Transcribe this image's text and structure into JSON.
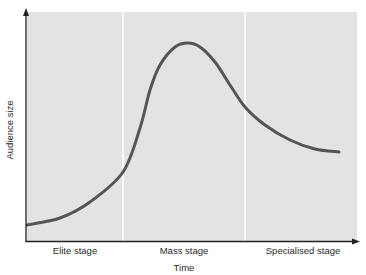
{
  "chart_data": {
    "type": "line",
    "title": "",
    "xlabel": "Time",
    "ylabel": "Audience size",
    "categories": [
      "Elite stage",
      "Mass stage",
      "Specialised stage"
    ],
    "x_ticks": [],
    "y_ticks": [],
    "grid": false,
    "legend": null,
    "series": [
      {
        "name": "Audience size over time",
        "points_px": [
          [
            27,
            225
          ],
          [
            60,
            218
          ],
          [
            90,
            202
          ],
          [
            123,
            172
          ],
          [
            140,
            128
          ],
          [
            150,
            90
          ],
          [
            160,
            65
          ],
          [
            175,
            47
          ],
          [
            188,
            43
          ],
          [
            200,
            47
          ],
          [
            215,
            62
          ],
          [
            230,
            85
          ],
          [
            245,
            107
          ],
          [
            265,
            125
          ],
          [
            290,
            140
          ],
          [
            315,
            149
          ],
          [
            339,
            152
          ]
        ],
        "values_normalized": [
          {
            "x": 0.0,
            "y": 0.07
          },
          {
            "x": 0.1,
            "y": 0.1
          },
          {
            "x": 0.19,
            "y": 0.18
          },
          {
            "x": 0.29,
            "y": 0.33
          },
          {
            "x": 0.34,
            "y": 0.54
          },
          {
            "x": 0.37,
            "y": 0.72
          },
          {
            "x": 0.4,
            "y": 0.85
          },
          {
            "x": 0.45,
            "y": 0.94
          },
          {
            "x": 0.49,
            "y": 0.96
          },
          {
            "x": 0.52,
            "y": 0.94
          },
          {
            "x": 0.57,
            "y": 0.86
          },
          {
            "x": 0.61,
            "y": 0.75
          },
          {
            "x": 0.66,
            "y": 0.64
          },
          {
            "x": 0.72,
            "y": 0.55
          },
          {
            "x": 0.79,
            "y": 0.48
          },
          {
            "x": 0.87,
            "y": 0.44
          },
          {
            "x": 0.94,
            "y": 0.42
          }
        ]
      }
    ],
    "stage_dividers_x_fraction": [
      0.295,
      0.66
    ],
    "colors": {
      "plot_background": "#e3e3e3",
      "curve": "#555555",
      "axis": "#222222",
      "divider": "#ffffff"
    }
  }
}
